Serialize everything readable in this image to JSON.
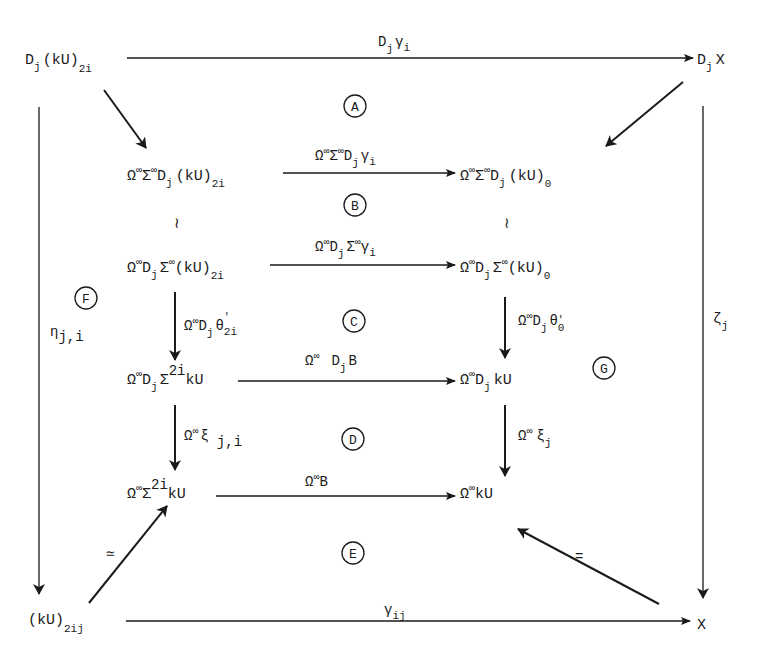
{
  "diagram": {
    "type": "commutative-diagram",
    "nodes": {
      "top_left": {
        "main": "D",
        "sub1": "j",
        "rest": "(kU)",
        "sub2": "2i"
      },
      "top_right": {
        "main": "D",
        "sub1": "j",
        "rest": "X"
      },
      "r1_left": {
        "pre": "Ω",
        "s1": "∞",
        "mid": "Σ",
        "s2": "∞",
        "d": "D",
        "sub1": "j",
        "rest": "(kU)",
        "sub2": "2i"
      },
      "r1_right": {
        "pre": "Ω",
        "s1": "∞",
        "mid": "Σ",
        "s2": "∞",
        "d": "D",
        "sub1": "j",
        "rest": "(kU)",
        "sub2": "0"
      },
      "r2_left": {
        "pre": "Ω",
        "s1": "∞",
        "d": "D",
        "sub1": "j",
        "mid": "Σ",
        "s2": "∞",
        "rest": "(kU)",
        "sub2": "2i"
      },
      "r2_right": {
        "pre": "Ω",
        "s1": "∞",
        "d": "D",
        "sub1": "j",
        "mid": "Σ",
        "s2": "∞",
        "rest": "(kU)",
        "sub2": "0"
      },
      "r3_left": {
        "pre": "Ω",
        "s1": "∞",
        "d": "D",
        "sub1": "j",
        "mid": "Σ",
        "s2": "2i",
        "rest": "kU"
      },
      "r3_right": {
        "pre": "Ω",
        "s1": "∞",
        "d": "D",
        "sub1": "j",
        "rest": "kU"
      },
      "r4_left": {
        "pre": "Ω",
        "s1": "∞",
        "mid": "Σ",
        "s2": "2i",
        "rest": "kU"
      },
      "r4_right": {
        "pre": "Ω",
        "s1": "∞",
        "rest": "kU"
      },
      "bottom_left": {
        "main": "(kU)",
        "sub": "2ij"
      },
      "bottom_right": {
        "main": "X"
      }
    },
    "arrows": {
      "top": {
        "d": "D",
        "sub": "j",
        "g": "γ",
        "gsub": "i"
      },
      "r1": {
        "pre": "Ω",
        "s1": "∞",
        "mid": "Σ",
        "s2": "∞",
        "d": "D",
        "sub": "j",
        "g": "γ",
        "gsub": "i"
      },
      "r2": {
        "pre": "Ω",
        "s1": "∞",
        "d": "D",
        "sub": "j",
        "mid": "Σ",
        "s2": "∞",
        "g": "γ",
        "gsub": "i"
      },
      "r3": {
        "pre": "Ω",
        "s1": "∞",
        "d": "D",
        "sub": "j",
        "rest": "B"
      },
      "r4": {
        "pre": "Ω",
        "s1": "∞",
        "rest": "B"
      },
      "bottom": {
        "g": "γ",
        "gsub": "ij"
      },
      "left_v_inner_1": {
        "pre": "Ω",
        "s1": "∞",
        "d": "D",
        "sub": "j",
        "t": "θ",
        "tsup": "'",
        "tsub": "2i"
      },
      "right_v_inner_1": {
        "pre": "Ω",
        "s1": "∞",
        "d": "D",
        "sub": "j",
        "t": "θ",
        "tsup": "'",
        "tsub": "0"
      },
      "left_v_inner_2": {
        "pre": "Ω",
        "s1": "∞",
        "x": "ξ",
        "xsub": "j,i"
      },
      "right_v_inner_2": {
        "pre": "Ω",
        "s1": "∞",
        "x": "ξ",
        "xsub": "j"
      },
      "left_outer": {
        "e": "η",
        "esub": "j,i"
      },
      "right_outer": {
        "z": "ζ",
        "zsub": "j"
      },
      "diag_bottom_left": {
        "label": "≃"
      },
      "diag_bottom_right": {
        "label": "="
      },
      "iso_left": {
        "label": "≀"
      },
      "iso_right": {
        "label": "≀"
      }
    },
    "regions": [
      "A",
      "B",
      "C",
      "D",
      "E",
      "F",
      "G"
    ]
  }
}
